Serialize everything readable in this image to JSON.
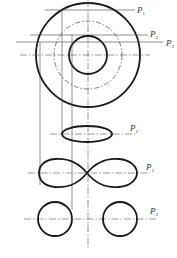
{
  "diagram": {
    "title": "",
    "top_view": {
      "center": [
        88,
        55
      ],
      "outer_radius": 52,
      "middle_dashed_radius": 34,
      "inner_radius": 19
    },
    "planes": [
      {
        "id": "P1",
        "label": "P",
        "subscript": "1",
        "y": 10
      },
      {
        "id": "P2",
        "label": "P",
        "subscript": "2",
        "y": 35
      },
      {
        "id": "P3",
        "label": "P",
        "subscript": "3",
        "y": 42
      }
    ],
    "sections": [
      {
        "plane": "P1",
        "shape": "ellipse",
        "label": "P",
        "subscript": "1"
      },
      {
        "plane": "P2",
        "shape": "lemniscate",
        "label": "P",
        "subscript": "2"
      },
      {
        "plane": "P3",
        "shape": "two-circles",
        "label": "P",
        "subscript": "3"
      }
    ],
    "colors": {
      "line": "#1a1a1a",
      "thin_line": "#444444",
      "background": "#ffffff"
    }
  }
}
